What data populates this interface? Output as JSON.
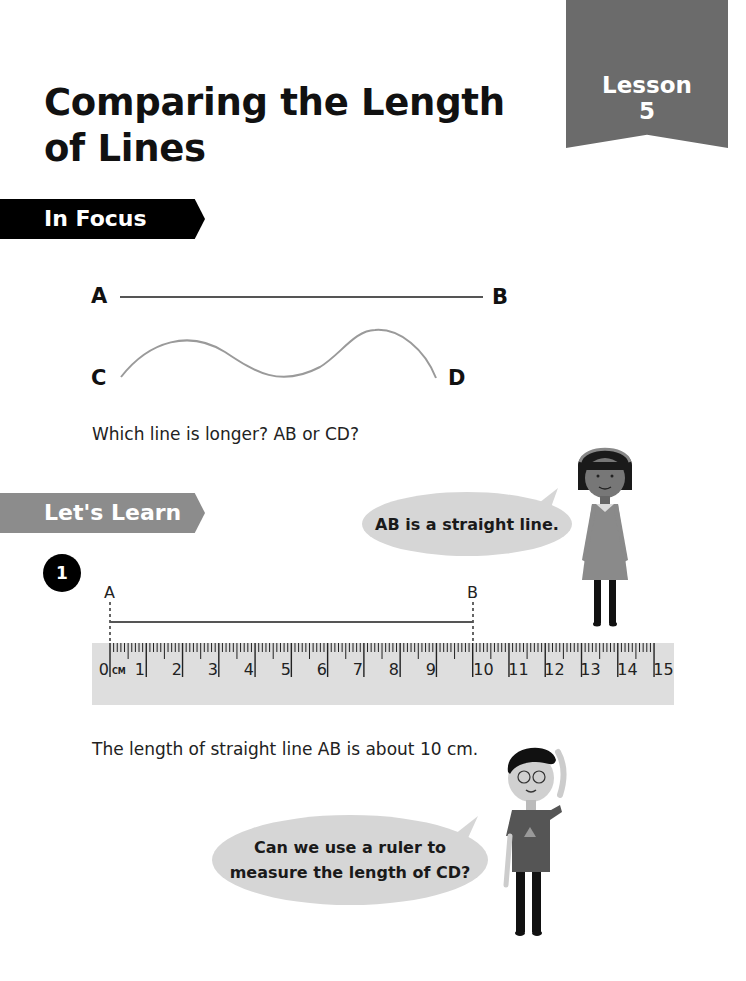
{
  "lesson": {
    "label": "Lesson",
    "number": "5"
  },
  "title": {
    "line1": "Comparing the Length",
    "line2": "of Lines"
  },
  "in_focus": {
    "tag": "In Focus",
    "points": {
      "A": "A",
      "B": "B",
      "C": "C",
      "D": "D"
    },
    "question": "Which line is longer? AB or CD?"
  },
  "lets_learn": {
    "tag": "Let's Learn",
    "step_number": "1",
    "girl_bubble": "AB is a straight line.",
    "line_labels": {
      "A": "A",
      "B": "B"
    },
    "ruler": {
      "unit": "CM",
      "numbers": [
        "0",
        "1",
        "2",
        "3",
        "4",
        "5",
        "6",
        "7",
        "8",
        "9",
        "10",
        "11",
        "12",
        "13",
        "14",
        "15"
      ]
    },
    "statement": "The length of straight line AB is about 10 cm.",
    "boy_bubble_line1": "Can we use a ruler to",
    "boy_bubble_line2": "measure the length of CD?"
  },
  "colors": {
    "lesson_banner": "#6b6b6b",
    "in_focus_tag": "#000000",
    "lets_learn_tag": "#8c8c8c",
    "bubble": "#d6d6d6",
    "ruler": "#dedede"
  }
}
